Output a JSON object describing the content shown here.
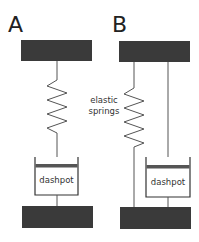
{
  "diagram": {
    "panels": [
      {
        "id": "A",
        "label": "A",
        "description": "Maxwell model: spring in series with dashpot",
        "components": [
          "top-plate",
          "elastic-spring",
          "dashpot",
          "bottom-plate"
        ],
        "dashpot_label": "dashpot"
      },
      {
        "id": "B",
        "label": "B",
        "description": "Kelvin-Voigt model: spring in parallel with dashpot",
        "components": [
          "top-plate",
          "elastic-spring",
          "dashpot",
          "bottom-plate"
        ],
        "dashpot_label": "dashpot"
      }
    ],
    "annotation": {
      "line1": "elastic",
      "line2": "springs"
    },
    "colors": {
      "plate": "#3a3a3a",
      "line": "#555555",
      "background": "#ffffff"
    }
  }
}
